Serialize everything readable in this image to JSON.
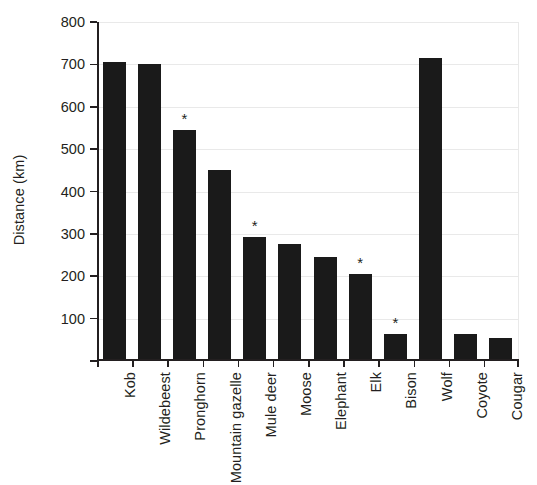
{
  "chart_data": {
    "type": "bar",
    "title": "",
    "xlabel": "",
    "ylabel": "Distance (km)",
    "ylim": [
      0,
      800
    ],
    "ytick_values": [
      0,
      100,
      200,
      300,
      400,
      500,
      600,
      700,
      800
    ],
    "ytick_labels": [
      "",
      "100",
      "200",
      "300",
      "400",
      "500",
      "600",
      "700",
      "800"
    ],
    "grid": "horizontal-light",
    "legend": "none",
    "bar_color": "#1a1a1a",
    "annotation_symbol": "*",
    "annotation_note": "Asterisk marks bars for Pronghorn, Mule deer, Elk and Bison",
    "categories": [
      "Kob",
      "Wildebeest",
      "Pronghorn",
      "Mountain gazelle",
      "Mule deer",
      "Moose",
      "Elephant",
      "Elk",
      "Bison",
      "Wolf",
      "Coyote",
      "Cougar"
    ],
    "values": [
      706,
      700,
      546,
      450,
      292,
      276,
      246,
      205,
      64,
      715,
      64,
      54
    ],
    "starred": [
      false,
      false,
      true,
      false,
      true,
      false,
      false,
      true,
      true,
      false,
      false,
      false
    ]
  },
  "axis": {
    "y_title": "Distance (km)"
  }
}
